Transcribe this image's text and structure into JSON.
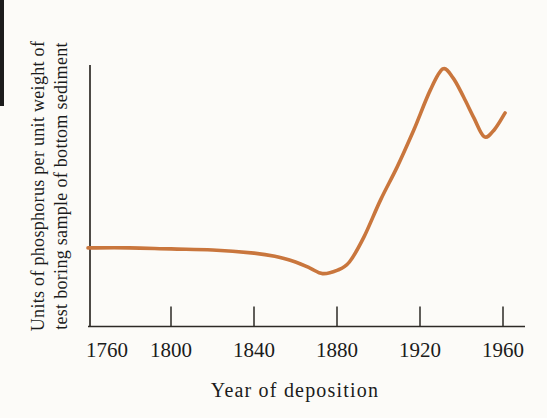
{
  "figure": {
    "background_color": "#fcfbf8",
    "axis_color": "#2d2a26",
    "text_color": "#1b1b1b",
    "curve_color": "#c9763d"
  },
  "chart_data": {
    "type": "line",
    "title": "",
    "xlabel": "Year of deposition",
    "ylabel_lines": [
      "Units of phosphorus per unit weight of",
      "test boring sample of bottom sediment"
    ],
    "x_ticks": [
      1760,
      1800,
      1840,
      1880,
      1920,
      1960
    ],
    "x_range": [
      1760,
      1970
    ],
    "y_range": [
      0,
      105
    ],
    "y_tick_labels": [],
    "grid": false,
    "legend": "none",
    "series": [
      {
        "name": "phosphorus per unit weight of bottom sediment",
        "color": "#c9763d",
        "x": [
          1760,
          1780,
          1800,
          1820,
          1840,
          1850,
          1860,
          1867,
          1873,
          1880,
          1886,
          1893,
          1901,
          1909,
          1917,
          1925,
          1931,
          1936,
          1941,
          1946,
          1951,
          1956,
          1961
        ],
        "y": [
          30.2,
          30.2,
          29.8,
          29.4,
          28.2,
          27.0,
          24.8,
          22.5,
          20.4,
          21.6,
          24.8,
          34.4,
          48.5,
          61.1,
          75.2,
          90.5,
          98.5,
          95.0,
          87.8,
          79.8,
          72.6,
          75.5,
          81.7
        ]
      }
    ]
  }
}
